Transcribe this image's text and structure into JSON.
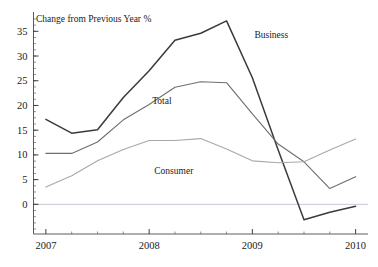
{
  "chart_data": {
    "type": "line",
    "title": "Change from Previous Year %",
    "xlabel": "",
    "ylabel": "",
    "xlim": [
      2006.88,
      2010.12
    ],
    "ylim": [
      -6,
      38.5
    ],
    "yticks": [
      0,
      5,
      10,
      15,
      20,
      25,
      30,
      35
    ],
    "ytick_labels": [
      "0",
      "5",
      "10",
      "15",
      "20",
      "25",
      "30",
      "35"
    ],
    "xticks": [
      2007,
      2008,
      2009,
      2010
    ],
    "xtick_labels": [
      "2007",
      "2008",
      "2009",
      "2010"
    ],
    "x_minor_tick_step": 0.25,
    "grid": false,
    "zero_line": true,
    "zero_line_color": "#b9b9c9",
    "legend": "inline-annotations",
    "x": [
      2007.0,
      2007.25,
      2007.5,
      2007.75,
      2008.0,
      2008.25,
      2008.5,
      2008.75,
      2009.0,
      2009.25,
      2009.5,
      2009.75,
      2010.0
    ],
    "series": [
      {
        "name": "Business",
        "color": "#3a3a3a",
        "width": 1.5,
        "values": [
          17.2,
          14.4,
          15.1,
          21.6,
          27.0,
          33.2,
          34.6,
          37.1,
          25.6,
          11.0,
          -3.1,
          -1.6,
          -0.4
        ],
        "label_x": 2009.02,
        "label_y": 33.6
      },
      {
        "name": "Total",
        "color": "#6e6e6e",
        "width": 1.1,
        "values": [
          10.3,
          10.3,
          12.6,
          17.1,
          20.2,
          23.7,
          24.8,
          24.6,
          18.3,
          12.2,
          8.6,
          3.2,
          5.6
        ],
        "label_x": 2008.03,
        "label_y": 20.3
      },
      {
        "name": "Consumer",
        "color": "#a8a8a8",
        "width": 1.1,
        "values": [
          3.5,
          5.8,
          8.8,
          11.1,
          12.9,
          12.9,
          13.3,
          11.2,
          8.8,
          8.4,
          8.6,
          11.0,
          13.2
        ],
        "label_x": 2008.05,
        "label_y": 6.2
      }
    ]
  },
  "axes": {
    "title_text": "Change from Previous Year %"
  }
}
